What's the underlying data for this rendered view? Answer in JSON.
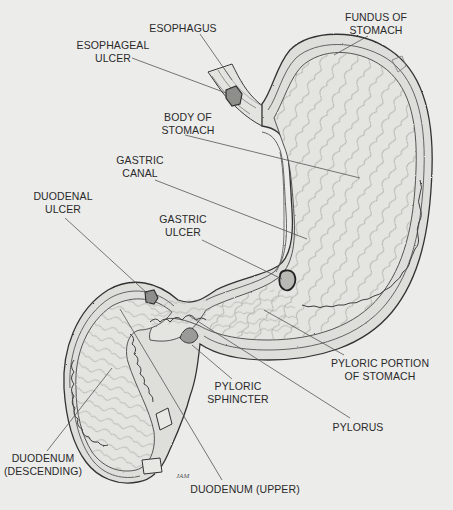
{
  "diagram": {
    "artist_signature": "JAM",
    "colors": {
      "background": "#ececea",
      "ink": "#3a3a3a",
      "fill": "#dcdcd8",
      "fill_light": "#e6e6e2",
      "label_text": "#2a2a2a",
      "leader_line": "#555555"
    },
    "labels": [
      {
        "id": "esophagus",
        "lines": [
          "ESOPHAGUS"
        ],
        "x": 183,
        "y": 22,
        "pointer": [
          [
            200,
            34
          ],
          [
            232,
            80
          ]
        ]
      },
      {
        "id": "esophageal-ulcer",
        "lines": [
          "ESOPHAGEAL",
          "ULCER"
        ],
        "x": 113,
        "y": 39,
        "pointer": [
          [
            132,
            58
          ],
          [
            226,
            93
          ]
        ]
      },
      {
        "id": "fundus",
        "lines": [
          "FUNDUS OF",
          "STOMACH"
        ],
        "x": 376,
        "y": 11,
        "pointer": [
          [
            368,
            36
          ],
          [
            334,
            55
          ]
        ]
      },
      {
        "id": "body",
        "lines": [
          "BODY OF",
          "STOMACH"
        ],
        "x": 188,
        "y": 111,
        "pointer": [
          [
            185,
            135
          ],
          [
            360,
            178
          ]
        ]
      },
      {
        "id": "gastric-canal",
        "lines": [
          "GASTRIC",
          "CANAL"
        ],
        "x": 140,
        "y": 154,
        "pointer": [
          [
            155,
            180
          ],
          [
            307,
            239
          ]
        ]
      },
      {
        "id": "duodenal-ulcer",
        "lines": [
          "DUODENAL",
          "ULCER"
        ],
        "x": 63,
        "y": 190,
        "pointer": [
          [
            65,
            218
          ],
          [
            148,
            294
          ]
        ]
      },
      {
        "id": "gastric-ulcer",
        "lines": [
          "GASTRIC",
          "ULCER"
        ],
        "x": 183,
        "y": 213,
        "pointer": [
          [
            202,
            240
          ],
          [
            282,
            279
          ]
        ]
      },
      {
        "id": "pyloric-portion",
        "lines": [
          "PYLORIC PORTION",
          "OF STOMACH"
        ],
        "x": 380,
        "y": 357,
        "pointer": [
          [
            344,
            355
          ],
          [
            264,
            310
          ]
        ]
      },
      {
        "id": "pyloric-sphincter",
        "lines": [
          "PYLORIC",
          "SPHINCTER"
        ],
        "x": 238,
        "y": 380,
        "pointer": [
          [
            232,
            379
          ],
          [
            192,
            345
          ]
        ]
      },
      {
        "id": "pylorus",
        "lines": [
          "PYLORUS"
        ],
        "x": 358,
        "y": 421,
        "pointer": [
          [
            350,
            418
          ],
          [
            188,
            315
          ]
        ]
      },
      {
        "id": "duodenum-descending",
        "lines": [
          "DUODENUM",
          "(DESCENDING)"
        ],
        "x": 43,
        "y": 452,
        "pointer": [
          [
            47,
            451
          ],
          [
            112,
            368
          ]
        ]
      },
      {
        "id": "duodenum-upper",
        "lines": [
          "DUODENUM (UPPER)"
        ],
        "x": 245,
        "y": 483,
        "pointer": [
          [
            222,
            480
          ],
          [
            120,
            309
          ]
        ]
      }
    ]
  }
}
